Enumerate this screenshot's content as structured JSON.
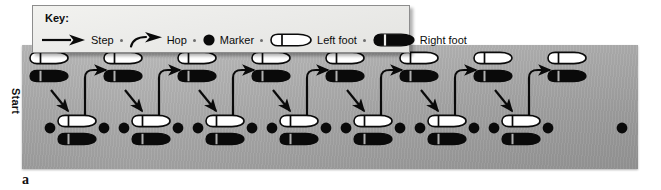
{
  "figure": {
    "label": "a",
    "start_label": "Start"
  },
  "key": {
    "title": "Key:",
    "items": [
      {
        "icon": "straight-arrow-icon",
        "label": "Step"
      },
      {
        "icon": "curved-hop-arrow-icon",
        "label": "Hop"
      },
      {
        "icon": "marker-dot-icon",
        "label": "Marker"
      },
      {
        "icon": "left-foot-outline-icon",
        "label": "Left foot"
      },
      {
        "icon": "right-foot-filled-icon",
        "label": "Right foot"
      }
    ]
  },
  "colors": {
    "panel_light": "#b4b4b4",
    "panel_dark": "#a2a2a2",
    "key_background": "#eeeeec",
    "ink": "#0a0a0a",
    "left_foot_fill": "#ffffff",
    "right_foot_fill": "#0a0a0a"
  },
  "diagram": {
    "type": "hopscotch-footprint-sequence",
    "top_row_label": "upper footprint pairs (left foot white above right foot black)",
    "bottom_row_label": "lower footprint clusters flanked by marker dots",
    "top_pairs_count": 8,
    "bottom_clusters_count": 7,
    "markers_per_cluster": 2,
    "trailing_marker_count": 1,
    "step_arrows_count": 7,
    "hop_arrows_count": 7,
    "top_pairs_x": [
      50,
      124,
      198,
      272,
      346,
      420,
      494,
      568
    ],
    "bottom_clusters_x": [
      78,
      152,
      226,
      300,
      374,
      448,
      522
    ],
    "trailing_marker_x": 625,
    "top_row_y": 58,
    "bottom_row_y": 122
  }
}
